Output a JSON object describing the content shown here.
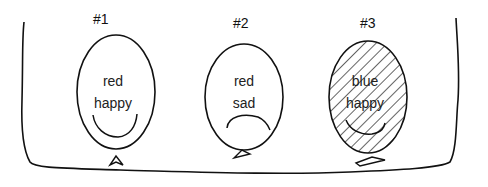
{
  "balloons": [
    {
      "number": "#1",
      "color": "red",
      "mood": "happy",
      "fill": "none"
    },
    {
      "number": "#2",
      "color": "red",
      "mood": "sad",
      "fill": "none"
    },
    {
      "number": "#3",
      "color": "blue",
      "mood": "happy",
      "fill": "diagonal-hatch"
    }
  ]
}
